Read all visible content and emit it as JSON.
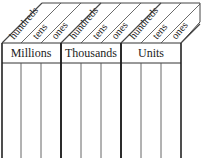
{
  "place_value_chart": {
    "groups": [
      {
        "label": "Millions",
        "columns": [
          "hundreds",
          "tens",
          "ones"
        ]
      },
      {
        "label": "Thousands",
        "columns": [
          "hundreds",
          "tens",
          "ones"
        ]
      },
      {
        "label": "Units",
        "columns": [
          "hundreds",
          "tens",
          "ones"
        ]
      }
    ]
  }
}
